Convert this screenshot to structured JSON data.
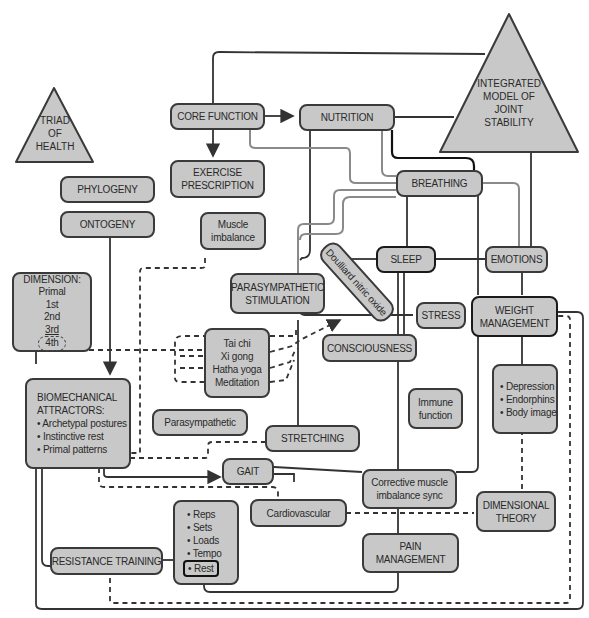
{
  "diagram": {
    "triangles": {
      "triad": {
        "lines": [
          "TRIAD",
          "OF",
          "HEALTH"
        ]
      },
      "integrated": {
        "lines": [
          "INTEGRATED",
          "MODEL OF",
          "JOINT",
          "STABILITY"
        ]
      }
    },
    "nodes": {
      "core_function": {
        "lines": [
          "CORE FUNCTION"
        ]
      },
      "nutrition": {
        "lines": [
          "NUTRITION"
        ]
      },
      "exercise_prescription": {
        "lines": [
          "EXERCISE",
          "PRESCRIPTION"
        ]
      },
      "phylogeny": {
        "lines": [
          "PHYLOGENY"
        ]
      },
      "ontogeny": {
        "lines": [
          "ONTOGENY"
        ]
      },
      "breathing": {
        "lines": [
          "BREATHING"
        ]
      },
      "muscle_imbalance": {
        "lines": [
          "Muscle",
          "imbalance"
        ]
      },
      "doulliard": {
        "lines": [
          "Doulliard nitric oxide"
        ]
      },
      "sleep": {
        "lines": [
          "SLEEP"
        ]
      },
      "emotions": {
        "lines": [
          "EMOTIONS"
        ]
      },
      "dimension": {
        "lines": [
          "DIMENSION:",
          "Primal",
          "1st",
          "2nd",
          "3rd",
          "4th"
        ]
      },
      "parasympathetic_stimulation": {
        "lines": [
          "PARASYMPATHETIC",
          "STIMULATION"
        ]
      },
      "stress": {
        "lines": [
          "STRESS"
        ]
      },
      "weight_management": {
        "lines": [
          "WEIGHT",
          "MANAGEMENT"
        ]
      },
      "mind_body": {
        "lines": [
          "Tai chi",
          "Xi gong",
          "Hatha yoga",
          "Meditation"
        ]
      },
      "consciousness": {
        "lines": [
          "CONSCIOUSNESS"
        ]
      },
      "biomechanical": {
        "lines": [
          "BIOMECHANICAL",
          "ATTRACTORS:",
          "• Archetypal postures",
          "• Instinctive rest",
          "• Primal patterns"
        ]
      },
      "mood": {
        "lines": [
          "• Depression",
          "• Endorphins",
          "• Body image"
        ]
      },
      "immune": {
        "lines": [
          "Immune",
          "function"
        ]
      },
      "parasympathetic": {
        "lines": [
          "Parasympathetic"
        ]
      },
      "stretching": {
        "lines": [
          "STRETCHING"
        ]
      },
      "gait": {
        "lines": [
          "GAIT"
        ]
      },
      "training_vars": {
        "lines": [
          "• Reps",
          "• Sets",
          "• Loads",
          "• Tempo",
          "• Rest"
        ]
      },
      "cardiovascular": {
        "lines": [
          "Cardiovascular"
        ]
      },
      "corrective": {
        "lines": [
          "Corrective muscle",
          "imbalance sync"
        ]
      },
      "dimensional_theory": {
        "lines": [
          "DIMENSIONAL",
          "THEORY"
        ]
      },
      "resistance_training": {
        "lines": [
          "RESISTANCE TRAINING"
        ]
      },
      "pain_management": {
        "lines": [
          "PAIN",
          "MANAGEMENT"
        ]
      }
    },
    "colors": {
      "node_fill": "#c8c8c8",
      "node_border": "#3a3a3a",
      "line_dark": "#222222",
      "line_gray": "#8a8a8a"
    }
  }
}
